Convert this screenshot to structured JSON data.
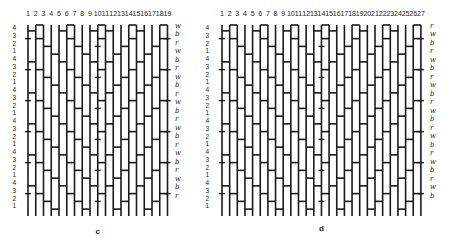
{
  "figure": {
    "panels": [
      {
        "id": "c",
        "caption": "c",
        "columns": [
          "1",
          "2",
          "3",
          "4",
          "5",
          "6",
          "7",
          "8",
          "9",
          "10",
          "11",
          "12",
          "13",
          "14",
          "15",
          "16",
          "17",
          "18",
          "19"
        ],
        "row_labels": [
          "4",
          "3",
          "2",
          "1",
          "4",
          "3",
          "2",
          "1",
          "4",
          "3",
          "2",
          "1",
          "4",
          "3",
          "2",
          "1",
          "4",
          "3",
          "2",
          "1",
          "4",
          "3",
          "2",
          "1"
        ],
        "color_labels": [
          "w",
          "b",
          "r",
          "w",
          "b",
          "r",
          "w",
          "b",
          "r",
          "w",
          "b",
          "r",
          "w",
          "b",
          "r",
          "w",
          "b",
          "r",
          "w",
          "b",
          "r"
        ],
        "geometry": {
          "x0": 28,
          "dx": 7.75,
          "y0": 27,
          "y1": 213,
          "label_x": 12,
          "color_x": 175,
          "num_y": 10,
          "caption_y": 227
        }
      },
      {
        "id": "d",
        "caption": "d",
        "columns": [
          "1",
          "2",
          "3",
          "4",
          "5",
          "6",
          "7",
          "8",
          "9",
          "10",
          "11",
          "12",
          "13",
          "14",
          "15",
          "16",
          "17",
          "18",
          "19",
          "20",
          "21",
          "22",
          "23",
          "24",
          "25",
          "26",
          "27"
        ],
        "row_labels": [
          "4",
          "3",
          "2",
          "1",
          "4",
          "3",
          "2",
          "1",
          "4",
          "3",
          "2",
          "1",
          "4",
          "3",
          "2",
          "1",
          "4",
          "3",
          "2",
          "1",
          "4",
          "3",
          "2",
          "1"
        ],
        "color_labels": [
          "r",
          "w",
          "b",
          "r",
          "w",
          "b",
          "r",
          "w",
          "b",
          "r",
          "w",
          "b",
          "r",
          "w",
          "b",
          "r",
          "w",
          "b",
          "r",
          "w",
          "b"
        ],
        "geometry": {
          "x0": 222,
          "dx": 7.65,
          "y0": 27,
          "y1": 213,
          "label_x": 205,
          "color_x": 430,
          "num_y": 10,
          "caption_y": 224
        }
      }
    ],
    "legend": {
      "w": "white",
      "b": "black",
      "r": "red"
    },
    "colors": {
      "ink": "#1a1a1a",
      "paper": "#ffffff"
    }
  }
}
